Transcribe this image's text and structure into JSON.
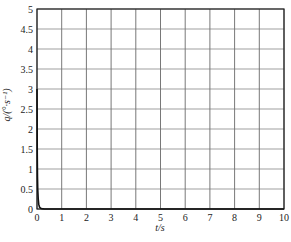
{
  "chart_data": {
    "type": "line",
    "title": "",
    "xlabel": "t/s",
    "ylabel": "q/(°·s⁻¹)",
    "xlim": [
      0,
      10
    ],
    "ylim": [
      0,
      5
    ],
    "grid": true,
    "legend": null,
    "x_ticks": [
      "0",
      "1",
      "2",
      "3",
      "4",
      "5",
      "6",
      "7",
      "8",
      "9",
      "10"
    ],
    "y_ticks": [
      "0",
      "0.5",
      "1",
      "1.5",
      "2",
      "2.5",
      "3",
      "3.5",
      "4",
      "4.5",
      "5"
    ],
    "series": [
      {
        "name": "q",
        "color": "#111111",
        "x": [
          0,
          0.01,
          0.02,
          0.03,
          0.05,
          0.07,
          0.1,
          0.15,
          0.2,
          0.3,
          0.5,
          1,
          2,
          5,
          10
        ],
        "y": [
          3.0,
          1.4,
          0.8,
          0.5,
          0.25,
          0.12,
          0.05,
          0.02,
          0.01,
          0.0,
          0.0,
          0.0,
          0.0,
          0.0,
          0.0
        ]
      }
    ]
  }
}
